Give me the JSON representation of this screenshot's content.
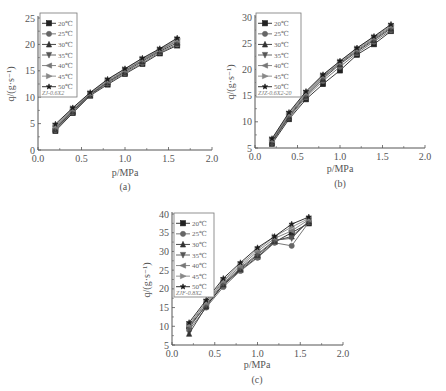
{
  "chart_data": [
    {
      "id": "a",
      "type": "line",
      "caption": "(a)",
      "title": "",
      "xlabel": "p/MPa",
      "ylabel": "q/(g·s⁻¹)",
      "xlim": [
        0.0,
        2.0
      ],
      "ylim": [
        0,
        25
      ],
      "xticks": [
        "0.0",
        "0.5",
        "1.0",
        "1.5",
        "2.0"
      ],
      "yticks": [
        "0",
        "5",
        "10",
        "15",
        "20",
        "25"
      ],
      "legend_position": "upper left",
      "legend_note": "ZJ-0.6X2",
      "x": [
        0.2,
        0.4,
        0.6,
        0.8,
        1.0,
        1.2,
        1.4,
        1.6
      ],
      "series": [
        {
          "name": "20℃",
          "marker": "square",
          "values": [
            3.6,
            7.0,
            10.3,
            12.4,
            14.4,
            16.3,
            18.3,
            19.8
          ]
        },
        {
          "name": "25℃",
          "marker": "circle",
          "values": [
            3.8,
            7.2,
            10.4,
            12.6,
            14.6,
            16.5,
            18.5,
            20.0
          ]
        },
        {
          "name": "30℃",
          "marker": "triangle-up",
          "values": [
            4.0,
            7.4,
            10.5,
            12.8,
            14.8,
            16.8,
            18.7,
            20.3
          ]
        },
        {
          "name": "35℃",
          "marker": "triangle-down",
          "values": [
            4.2,
            7.5,
            10.6,
            12.9,
            15.0,
            17.0,
            18.9,
            20.6
          ]
        },
        {
          "name": "40℃",
          "marker": "triangle-left",
          "values": [
            4.4,
            7.7,
            10.7,
            13.1,
            15.1,
            17.1,
            19.0,
            20.8
          ]
        },
        {
          "name": "45℃",
          "marker": "triangle-right",
          "values": [
            4.6,
            7.9,
            10.8,
            13.3,
            15.3,
            17.3,
            19.1,
            21.0
          ]
        },
        {
          "name": "50℃",
          "marker": "star",
          "values": [
            4.9,
            8.0,
            10.9,
            13.4,
            15.4,
            17.4,
            19.2,
            21.2
          ]
        }
      ]
    },
    {
      "id": "b",
      "type": "line",
      "caption": "(b)",
      "title": "",
      "xlabel": "p/MPa",
      "ylabel": "q/(g·s⁻¹)",
      "xlim": [
        0.0,
        2.0
      ],
      "ylim": [
        5,
        30
      ],
      "xticks": [
        "0.0",
        "0.5",
        "1.0",
        "1.5",
        "2.0"
      ],
      "yticks": [
        "5",
        "10",
        "15",
        "20",
        "25",
        "30"
      ],
      "legend_position": "upper left",
      "legend_note": "ZJZ-0.6X2-20",
      "x": [
        0.2,
        0.4,
        0.6,
        0.8,
        1.0,
        1.2,
        1.4,
        1.6
      ],
      "series": [
        {
          "name": "20℃",
          "marker": "square",
          "values": [
            5.8,
            10.5,
            14.3,
            17.2,
            19.8,
            22.8,
            24.8,
            27.3
          ]
        },
        {
          "name": "25℃",
          "marker": "circle",
          "values": [
            6.0,
            10.8,
            14.7,
            17.8,
            20.5,
            23.1,
            25.3,
            27.5
          ]
        },
        {
          "name": "30℃",
          "marker": "triangle-up",
          "values": [
            6.2,
            11.0,
            15.0,
            18.2,
            21.0,
            23.4,
            25.6,
            27.8
          ]
        },
        {
          "name": "35℃",
          "marker": "triangle-down",
          "values": [
            6.4,
            11.2,
            15.2,
            18.5,
            21.2,
            23.6,
            25.8,
            28.0
          ]
        },
        {
          "name": "40℃",
          "marker": "triangle-left",
          "values": [
            6.5,
            11.4,
            15.4,
            18.7,
            21.3,
            23.8,
            26.0,
            28.2
          ]
        },
        {
          "name": "45℃",
          "marker": "triangle-right",
          "values": [
            6.7,
            11.6,
            15.6,
            18.9,
            21.5,
            24.0,
            26.2,
            28.4
          ]
        },
        {
          "name": "50℃",
          "marker": "star",
          "values": [
            6.8,
            11.8,
            15.8,
            19.0,
            21.6,
            24.1,
            26.3,
            28.6
          ]
        }
      ]
    },
    {
      "id": "c",
      "type": "line",
      "caption": "(c)",
      "title": "",
      "xlabel": "p/MPa",
      "ylabel": "q/(g·s⁻¹)",
      "xlim": [
        0.0,
        2.0
      ],
      "ylim": [
        5,
        40
      ],
      "xticks": [
        "0.0",
        "0.5",
        "1.0",
        "1.5",
        "2.0"
      ],
      "yticks": [
        "5",
        "10",
        "15",
        "20",
        "25",
        "30",
        "35",
        "40"
      ],
      "legend_position": "upper left",
      "legend_note": "ZJF-0.8X2",
      "x": [
        0.2,
        0.4,
        0.6,
        0.8,
        1.0,
        1.2,
        1.4,
        1.6
      ],
      "series": [
        {
          "name": "20℃",
          "marker": "square",
          "values": [
            10.0,
            15.5,
            21.0,
            25.0,
            28.5,
            32.5,
            35.0,
            37.5
          ]
        },
        {
          "name": "25℃",
          "marker": "circle",
          "values": [
            9.0,
            15.0,
            20.5,
            24.8,
            28.3,
            32.3,
            31.5,
            37.8
          ]
        },
        {
          "name": "30℃",
          "marker": "triangle-up",
          "values": [
            8.0,
            15.3,
            21.2,
            25.3,
            29.0,
            32.8,
            34.0,
            38.0
          ]
        },
        {
          "name": "35℃",
          "marker": "triangle-down",
          "values": [
            9.5,
            15.8,
            21.5,
            25.6,
            29.3,
            33.0,
            33.5,
            38.2
          ]
        },
        {
          "name": "40℃",
          "marker": "triangle-left",
          "values": [
            10.2,
            16.2,
            22.0,
            26.0,
            30.0,
            33.5,
            35.5,
            38.5
          ]
        },
        {
          "name": "45℃",
          "marker": "triangle-right",
          "values": [
            10.5,
            16.5,
            22.3,
            26.5,
            30.5,
            34.0,
            36.5,
            38.8
          ]
        },
        {
          "name": "50℃",
          "marker": "star",
          "values": [
            11.0,
            17.0,
            22.8,
            27.0,
            31.0,
            34.0,
            37.3,
            39.2
          ]
        }
      ]
    }
  ],
  "layout": {
    "panels": [
      {
        "ox": 38,
        "x2": 212,
        "top": 18,
        "bottom": 150,
        "legend": {
          "x": 40,
          "y": 13,
          "w": 37,
          "h": 84
        },
        "ylabel_x": 14,
        "ylabel_y": 84,
        "xlabel_x": 125,
        "xlabel_y": 176,
        "cap_x": 125,
        "cap_y": 190
      },
      {
        "ox": 255,
        "x2": 425,
        "top": 17,
        "bottom": 148,
        "legend": {
          "x": 256,
          "y": 13,
          "w": 45,
          "h": 84
        },
        "ylabel_x": 234,
        "ylabel_y": 82,
        "xlabel_x": 340,
        "xlabel_y": 172,
        "cap_x": 340,
        "cap_y": 187
      },
      {
        "ox": 172,
        "x2": 343,
        "top": 214,
        "bottom": 345,
        "legend": {
          "x": 174,
          "y": 213,
          "w": 40,
          "h": 84
        },
        "ylabel_x": 150,
        "ylabel_y": 280,
        "xlabel_x": 257,
        "xlabel_y": 368,
        "cap_x": 257,
        "cap_y": 383
      }
    ],
    "colors": {
      "axis": "#555555",
      "series": [
        "#222222",
        "#666666",
        "#333333",
        "#555555",
        "#777777",
        "#888888",
        "#1a1a1a"
      ]
    }
  }
}
